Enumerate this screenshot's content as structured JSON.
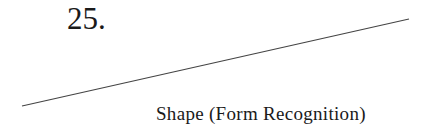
{
  "item": {
    "number": "25.",
    "caption": "Shape (Form Recognition)"
  },
  "figure": {
    "line": {
      "x1": 22,
      "y1": 106,
      "x2": 409,
      "y2": 19,
      "color": "#444444"
    }
  }
}
